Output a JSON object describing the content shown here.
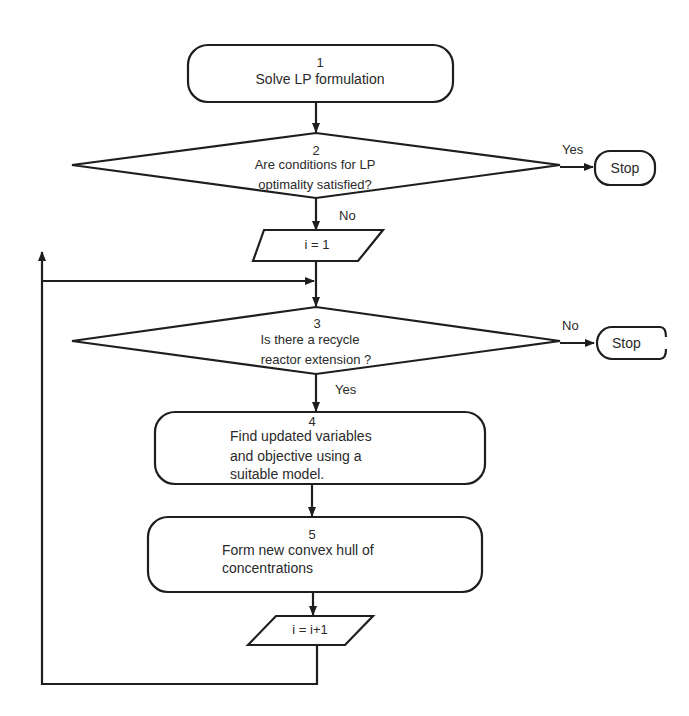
{
  "nodes": {
    "n1": {
      "number": "1",
      "lines": [
        "Solve LP formulation"
      ]
    },
    "n2": {
      "number": "2",
      "lines": [
        "Are conditions for LP",
        "optimality satisfied?"
      ]
    },
    "stop1": {
      "label": "Stop"
    },
    "init": {
      "label": "i = 1"
    },
    "n3": {
      "number": "3",
      "lines": [
        "Is there a recycle",
        "reactor extension ?"
      ]
    },
    "stop2": {
      "label": "Stop"
    },
    "n4": {
      "number": "4",
      "lines": [
        "Find updated variables",
        "and objective using a",
        "suitable model."
      ]
    },
    "n5": {
      "number": "5",
      "lines": [
        "Form new convex hull of",
        "concentrations"
      ]
    },
    "incr": {
      "label": "i = i+1"
    }
  },
  "edges": {
    "n2_yes": "Yes",
    "n2_no": "No",
    "n3_no": "No",
    "n3_yes": "Yes"
  },
  "colors": {
    "stroke": "#1e1e1e",
    "background": "#ffffff",
    "text": "#2a2a2a"
  }
}
